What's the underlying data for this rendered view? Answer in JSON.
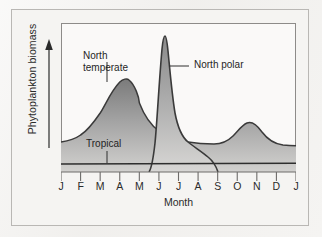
{
  "figure": {
    "background_color": "#f3f2f0",
    "plot_background_color": "#faf9f8",
    "line_color": "#3a3a3a"
  },
  "chart_data": {
    "type": "line",
    "title": "",
    "xlabel": "Month",
    "ylabel": "Phytoplankton biomass",
    "categories": [
      "J",
      "F",
      "M",
      "A",
      "M",
      "J",
      "J",
      "A",
      "S",
      "O",
      "N",
      "D",
      "J"
    ],
    "x": [
      1,
      2,
      3,
      4,
      5,
      6,
      7,
      8,
      9,
      10,
      11,
      12,
      13
    ],
    "xlim": [
      1,
      13
    ],
    "ylim": [
      0,
      1
    ],
    "grid": false,
    "legend_position": "inline-annotations",
    "y_axis_arrow": true,
    "y_axis_ticks": false,
    "series": [
      {
        "name": "North temperate",
        "label": "North temperate",
        "fill": true,
        "values": [
          0.2,
          0.24,
          0.4,
          0.66,
          0.52,
          0.38,
          0.3,
          0.26,
          0.25,
          0.33,
          0.24,
          0.21,
          0.2
        ],
        "annotation": {
          "text": "North temperate",
          "x": 3.6,
          "y": 0.78
        }
      },
      {
        "name": "North polar",
        "label": "North polar",
        "fill": true,
        "values": [
          0.0,
          0.0,
          0.0,
          0.0,
          0.0,
          0.05,
          0.97,
          0.34,
          0.12,
          0.0,
          0.0,
          0.0,
          0.0
        ],
        "annotation": {
          "text": "North polar",
          "x": 8.2,
          "y": 0.84
        }
      },
      {
        "name": "Tropical",
        "label": "Tropical",
        "fill": false,
        "values": [
          0.055,
          0.055,
          0.055,
          0.055,
          0.055,
          0.055,
          0.055,
          0.055,
          0.055,
          0.055,
          0.055,
          0.055,
          0.055
        ],
        "annotation": {
          "text": "Tropical",
          "x": 3.4,
          "y": 0.2
        }
      }
    ]
  }
}
